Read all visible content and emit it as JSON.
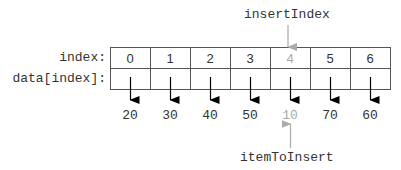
{
  "labels": {
    "insert_index": "insertIndex",
    "item_to_insert": "itemToInsert",
    "index_row": "index:",
    "data_row": "data[index]:"
  },
  "array": {
    "indices": [
      "0",
      "1",
      "2",
      "3",
      "4",
      "5",
      "6"
    ],
    "values": [
      "20",
      "30",
      "40",
      "50",
      "10",
      "70",
      "60"
    ],
    "highlight_index": 4
  },
  "colors": {
    "line": "#555555",
    "arrow": "#000000",
    "highlight": "#aaaaaa",
    "text": "#333333"
  }
}
